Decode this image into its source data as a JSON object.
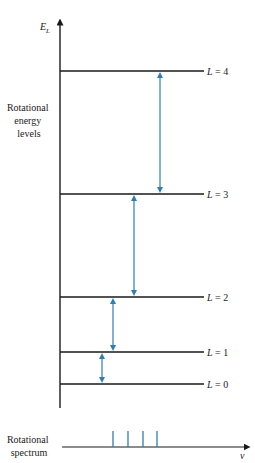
{
  "axis": {
    "y_label_main": "E",
    "y_label_sub": "L",
    "x_label": "ν"
  },
  "side_label": [
    "Rotational",
    "energy",
    "levels"
  ],
  "spectrum_label": [
    "Rotational",
    "spectrum"
  ],
  "levels": [
    {
      "L": 4,
      "label": "L = 4",
      "y": 71
    },
    {
      "L": 3,
      "label": "L = 3",
      "y": 194
    },
    {
      "L": 2,
      "label": "L = 2",
      "y": 297
    },
    {
      "L": 1,
      "label": "L = 1",
      "y": 352
    },
    {
      "L": 0,
      "label": "L = 0",
      "y": 384
    }
  ],
  "transitions": [
    {
      "from": 3,
      "to": 4,
      "x": 160
    },
    {
      "from": 2,
      "to": 3,
      "x": 134
    },
    {
      "from": 1,
      "to": 2,
      "x": 113
    },
    {
      "from": 0,
      "to": 1,
      "x": 102
    }
  ],
  "spectrum_lines_x": [
    113,
    128,
    143,
    157
  ],
  "colors": {
    "line": "#1a1a1a",
    "transition": "#2e7fb0"
  }
}
